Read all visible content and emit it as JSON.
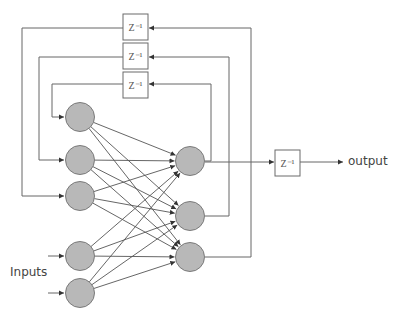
{
  "diagram": {
    "type": "recurrent-neural-network",
    "labels": {
      "inputs": "Inputs",
      "output": "output",
      "delay": "Z⁻¹"
    },
    "colors": {
      "node_fill": "#b8b8b8",
      "node_stroke": "#7a7a7a",
      "line": "#555555",
      "box_stroke": "#6a6a6a"
    },
    "input_layer": [
      {
        "id": "in1",
        "role": "context",
        "cx": 80,
        "cy": 117
      },
      {
        "id": "in2",
        "role": "context",
        "cx": 80,
        "cy": 160
      },
      {
        "id": "in3",
        "role": "context",
        "cx": 80,
        "cy": 196
      },
      {
        "id": "in4",
        "role": "input",
        "cx": 80,
        "cy": 256
      },
      {
        "id": "in5",
        "role": "input",
        "cx": 80,
        "cy": 293
      }
    ],
    "output_layer": [
      {
        "id": "out1",
        "cx": 190,
        "cy": 161
      },
      {
        "id": "out2",
        "cx": 190,
        "cy": 216
      },
      {
        "id": "out3",
        "cx": 190,
        "cy": 257
      }
    ],
    "delay_boxes": [
      {
        "id": "z1",
        "label": "Z⁻¹",
        "feeds": "in3",
        "from": "out3"
      },
      {
        "id": "z2",
        "label": "Z⁻¹",
        "feeds": "in2",
        "from": "out2"
      },
      {
        "id": "z3",
        "label": "Z⁻¹",
        "feeds": "in1",
        "from": "out1"
      },
      {
        "id": "z_out",
        "label": "Z⁻¹",
        "feeds": "output",
        "from": "out1"
      }
    ],
    "connections": "fully-connected input_layer -> output_layer"
  }
}
